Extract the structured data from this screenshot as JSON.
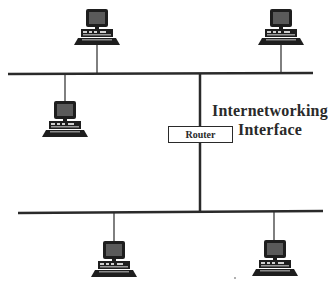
{
  "diagram": {
    "type": "network-topology",
    "labels": {
      "title_line1": "Internetworking",
      "title_line2": "Interface",
      "router": "Router"
    },
    "colors": {
      "line": "#2a2a2a",
      "background": "#ffffff",
      "computer_dark": "#1e1e1e",
      "computer_screen": "#5a5a5a"
    },
    "networks": [
      {
        "name": "top-network",
        "bus": {
          "x1": 8,
          "y1": 74,
          "x2": 313,
          "y2": 73
        },
        "computers": [
          {
            "name": "computer-top-left",
            "x": 73,
            "y": 9,
            "drop_x": 97,
            "position": "above"
          },
          {
            "name": "computer-top-right",
            "x": 258,
            "y": 9,
            "drop_x": 281,
            "position": "above"
          },
          {
            "name": "computer-middle-left",
            "x": 42,
            "y": 101,
            "drop_x": 65,
            "position": "below"
          }
        ]
      },
      {
        "name": "bottom-network",
        "bus": {
          "x1": 18,
          "y1": 213,
          "x2": 323,
          "y2": 211
        },
        "computers": [
          {
            "name": "computer-bottom-left",
            "x": 91,
            "y": 241,
            "drop_x": 114,
            "position": "below"
          },
          {
            "name": "computer-bottom-right",
            "x": 252,
            "y": 241,
            "drop_x": 274,
            "position": "below"
          }
        ]
      }
    ],
    "router_link": {
      "x": 200,
      "y_top": 73,
      "y_bottom": 212
    }
  }
}
